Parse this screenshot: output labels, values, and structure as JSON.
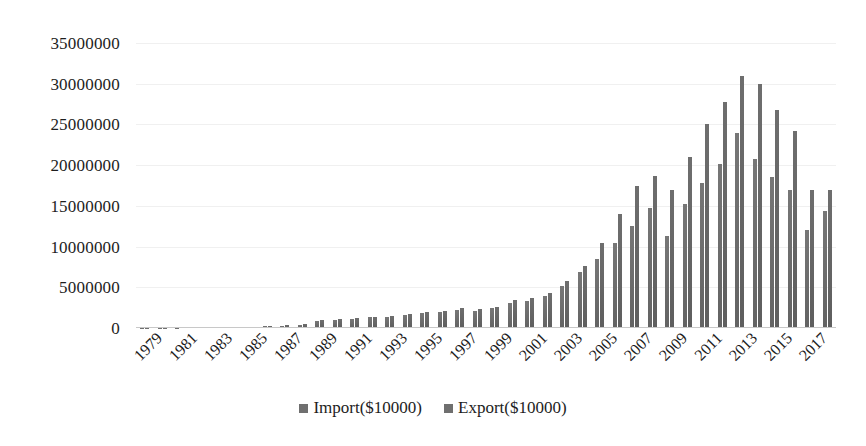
{
  "chart_data": {
    "type": "bar",
    "title": "",
    "xlabel": "",
    "ylabel": "",
    "ylim": [
      0,
      35000000
    ],
    "yticks": [
      35000000,
      30000000,
      25000000,
      20000000,
      15000000,
      10000000,
      5000000,
      0
    ],
    "ytick_labels": [
      "35000000",
      "30000000",
      "25000000",
      "20000000",
      "15000000",
      "10000000",
      "5000000",
      "0"
    ],
    "grid": true,
    "legend_position": "bottom",
    "categories": [
      "1979",
      "1980",
      "1981",
      "1982",
      "1983",
      "1984",
      "1985",
      "1986",
      "1987",
      "1988",
      "1989",
      "1990",
      "1991",
      "1992",
      "1993",
      "1994",
      "1995",
      "1996",
      "1997",
      "1998",
      "1999",
      "2000",
      "2001",
      "2002",
      "2003",
      "2004",
      "2005",
      "2006",
      "2007",
      "2008",
      "2009",
      "2010",
      "2011",
      "2012",
      "2013",
      "2014",
      "2015",
      "2016",
      "2017",
      "2018"
    ],
    "xtick_labels": [
      "1979",
      "1981",
      "1983",
      "1985",
      "1987",
      "1989",
      "1991",
      "1993",
      "1995",
      "1997",
      "1999",
      "2001",
      "2003",
      "2005",
      "2007",
      "2009",
      "2011",
      "2013",
      "2015",
      "2017"
    ],
    "series": [
      {
        "name": "Import($10000)",
        "color": "#6f6f6f",
        "values": [
          20000,
          40000,
          60000,
          70000,
          90000,
          120000,
          160000,
          200000,
          280000,
          420000,
          900000,
          1000000,
          1150000,
          1300000,
          1400000,
          1600000,
          1800000,
          2000000,
          2200000,
          2150000,
          2400000,
          3100000,
          3300000,
          3900000,
          5200000,
          6900000,
          8500000,
          10400000,
          12500000,
          14800000,
          11300000,
          15200000,
          17800000,
          20200000,
          23900000,
          20700000,
          18500000,
          16900000,
          12000000,
          14400000
        ]
      },
      {
        "name": "Export($10000)",
        "color": "#6f6f6f",
        "values": [
          25000,
          45000,
          65000,
          80000,
          100000,
          130000,
          170000,
          230000,
          320000,
          500000,
          1000000,
          1100000,
          1250000,
          1400000,
          1500000,
          1750000,
          1950000,
          2150000,
          2400000,
          2300000,
          2600000,
          3400000,
          3700000,
          4300000,
          5800000,
          7600000,
          10500000,
          14000000,
          17400000,
          18700000,
          16900000,
          21000000,
          25000000,
          27800000,
          31000000,
          30000000,
          26800000,
          24200000,
          16900000,
          17000000
        ]
      }
    ],
    "legend": [
      {
        "label": "Import($10000)",
        "swatch": "#6f6f6f"
      },
      {
        "label": "Export($10000)",
        "swatch": "#6f6f6f"
      }
    ]
  }
}
